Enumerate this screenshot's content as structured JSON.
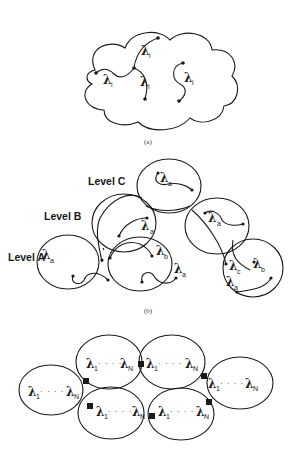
{
  "panel_a": {
    "caption": "(a)",
    "labels": [
      {
        "symbol": "λ",
        "sub": "i"
      },
      {
        "symbol": "λ",
        "sub": "i"
      },
      {
        "symbol": "λ",
        "sub": "i"
      },
      {
        "symbol": "λ",
        "sub": "i"
      }
    ]
  },
  "panel_b": {
    "caption": "(b)",
    "levels": [
      "Level C",
      "Level B",
      "Level A"
    ],
    "labels": {
      "c_top": {
        "symbol": "λ",
        "sub": "a"
      },
      "b_left": {
        "symbol": "λ",
        "sub": "a"
      },
      "b_right": {
        "symbol": "λ",
        "sub": "a"
      },
      "a1": {
        "symbol": "λ",
        "sub": "a"
      },
      "a2_b": {
        "symbol": "λ",
        "sub": "b"
      },
      "a2_a": {
        "symbol": "λ",
        "sub": "a"
      },
      "a3_c": {
        "symbol": "λ",
        "sub": "c"
      },
      "a3_b": {
        "symbol": "λ",
        "sub": "b"
      },
      "a3_a": {
        "symbol": "λ",
        "sub": "a"
      }
    }
  },
  "panel_c": {
    "cell_label": {
      "first": "λ",
      "first_sub": "1",
      "ellipsis": "· · · ·",
      "last": "λ",
      "last_sub": "N"
    }
  }
}
